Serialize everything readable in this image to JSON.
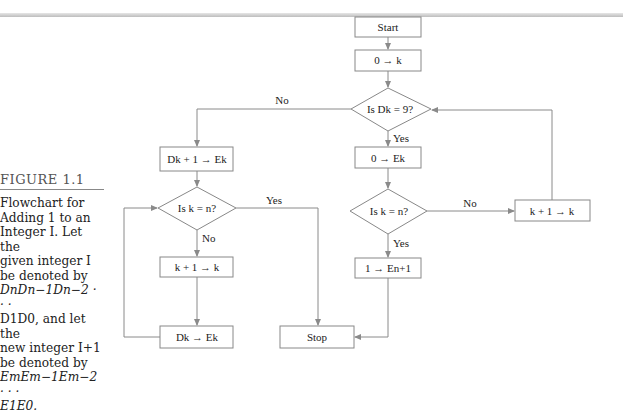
{
  "figure": {
    "label": "FIGURE 1.1",
    "caption_lines": [
      "Flowchart for",
      "Adding 1 to an",
      "Integer I. Let the",
      "given integer I",
      "be denoted by",
      "DnDn−1Dn−2 · · ·",
      "D1D0, and let the",
      "new integer I+1",
      "be denoted by",
      "EmEm−1Em−2 · · ·",
      "E1E0."
    ]
  },
  "flowchart": {
    "nodes": {
      "start": "Start",
      "init_k": "0 → k",
      "decision_dk9": "Is Dk = 9?",
      "inc_digit": "Dk + 1 → Ek",
      "zero_ek": "0 → Ek",
      "decision_left_kn": "Is k = n?",
      "decision_right_kn": "Is k = n?",
      "inc_k_right": "k + 1 → k",
      "inc_k_left": "k + 1 → k",
      "set_carry": "1 → En+1",
      "copy_digit": "Dk → Ek",
      "stop": "Stop"
    },
    "edge_labels": {
      "dk9_no": "No",
      "dk9_yes": "Yes",
      "left_kn_yes": "Yes",
      "left_kn_no": "No",
      "right_kn_no": "No",
      "right_kn_yes": "Yes"
    }
  }
}
